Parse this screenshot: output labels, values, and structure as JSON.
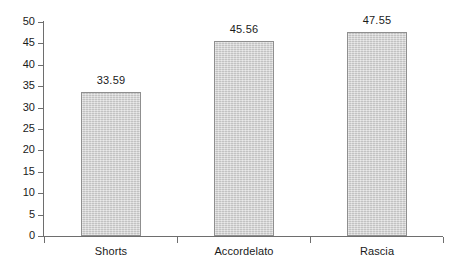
{
  "chart_data": {
    "type": "bar",
    "title": "",
    "subtitle": "",
    "xlabel": "",
    "ylabel": "",
    "categories": [
      "Shorts",
      "Accordelato",
      "Rascia"
    ],
    "values": [
      33.59,
      45.56,
      47.55
    ],
    "value_labels": [
      "33.59",
      "45.56",
      "47.55"
    ],
    "ylim": [
      0,
      50
    ],
    "ytick_step": 5,
    "ytick_labels": [
      "0",
      "5",
      "10",
      "15",
      "20",
      "25",
      "30",
      "35",
      "40",
      "45",
      "50"
    ],
    "grid": false,
    "legend": null,
    "legend_position": "none",
    "data_labels_shown": true,
    "series": [
      {
        "name": "",
        "values": [
          33.59,
          45.56,
          47.55
        ]
      }
    ],
    "colors": {
      "bar_fill": "#cdcdcd",
      "bar_border": "#8f8f8f",
      "axis": "#6e6e6e",
      "text": "#1a1a1a",
      "background": "#ffffff"
    }
  }
}
